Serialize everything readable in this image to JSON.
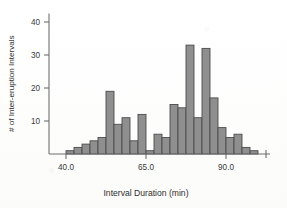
{
  "chart_data": {
    "type": "bar",
    "title": "",
    "subtitle": "",
    "xlabel": "Interval Duration (min)",
    "ylabel": "# of Inter-eruption Intervals",
    "xlim": [
      37.0,
      103.0
    ],
    "ylim": [
      0,
      43
    ],
    "grid": false,
    "legend": null,
    "bin_width": 2.5,
    "bin_start": 40.0,
    "x_ticks": [
      40.0,
      65.0,
      90.0
    ],
    "x_tick_labels": [
      "40.0",
      "65.0",
      "90.0"
    ],
    "y_ticks": [
      10,
      20,
      30,
      40
    ],
    "y_tick_labels": [
      "10",
      "20",
      "30",
      "40"
    ],
    "bar_fill_color": "#8f8f8f",
    "bar_edge_color": "#4c4c4c",
    "axis_color": "#6f6f6f",
    "background_color": "#fdfdfc",
    "bins": [
      {
        "x0": 40.0,
        "x1": 42.5,
        "value": 1
      },
      {
        "x0": 42.5,
        "x1": 45.0,
        "value": 2
      },
      {
        "x0": 45.0,
        "x1": 47.5,
        "value": 3
      },
      {
        "x0": 47.5,
        "x1": 50.0,
        "value": 4
      },
      {
        "x0": 50.0,
        "x1": 52.5,
        "value": 5
      },
      {
        "x0": 52.5,
        "x1": 55.0,
        "value": 19
      },
      {
        "x0": 55.0,
        "x1": 57.5,
        "value": 9
      },
      {
        "x0": 57.5,
        "x1": 60.0,
        "value": 11
      },
      {
        "x0": 60.0,
        "x1": 62.5,
        "value": 4
      },
      {
        "x0": 62.5,
        "x1": 65.0,
        "value": 12
      },
      {
        "x0": 65.0,
        "x1": 67.5,
        "value": 1
      },
      {
        "x0": 67.5,
        "x1": 70.0,
        "value": 6
      },
      {
        "x0": 70.0,
        "x1": 72.5,
        "value": 5
      },
      {
        "x0": 72.5,
        "x1": 75.0,
        "value": 15
      },
      {
        "x0": 75.0,
        "x1": 77.5,
        "value": 14
      },
      {
        "x0": 77.5,
        "x1": 80.0,
        "value": 33
      },
      {
        "x0": 80.0,
        "x1": 82.5,
        "value": 11
      },
      {
        "x0": 82.5,
        "x1": 85.0,
        "value": 32
      },
      {
        "x0": 85.0,
        "x1": 87.5,
        "value": 17
      },
      {
        "x0": 87.5,
        "x1": 90.0,
        "value": 8
      },
      {
        "x0": 90.0,
        "x1": 92.5,
        "value": 5
      },
      {
        "x0": 92.5,
        "x1": 95.0,
        "value": 6
      },
      {
        "x0": 95.0,
        "x1": 97.5,
        "value": 2
      },
      {
        "x0": 97.5,
        "x1": 100.0,
        "value": 1
      }
    ],
    "categories": [
      "40.0-42.5",
      "42.5-45.0",
      "45.0-47.5",
      "47.5-50.0",
      "50.0-52.5",
      "52.5-55.0",
      "55.0-57.5",
      "57.5-60.0",
      "60.0-62.5",
      "62.5-65.0",
      "65.0-67.5",
      "67.5-70.0",
      "70.0-72.5",
      "72.5-75.0",
      "75.0-77.5",
      "77.5-80.0",
      "80.0-82.5",
      "82.5-85.0",
      "85.0-87.5",
      "87.5-90.0",
      "90.0-92.5",
      "92.5-95.0",
      "95.0-97.5",
      "97.5-100.0"
    ],
    "values": [
      1,
      2,
      3,
      4,
      5,
      19,
      9,
      11,
      4,
      12,
      1,
      6,
      5,
      15,
      14,
      33,
      11,
      32,
      17,
      8,
      5,
      6,
      2,
      1
    ]
  }
}
